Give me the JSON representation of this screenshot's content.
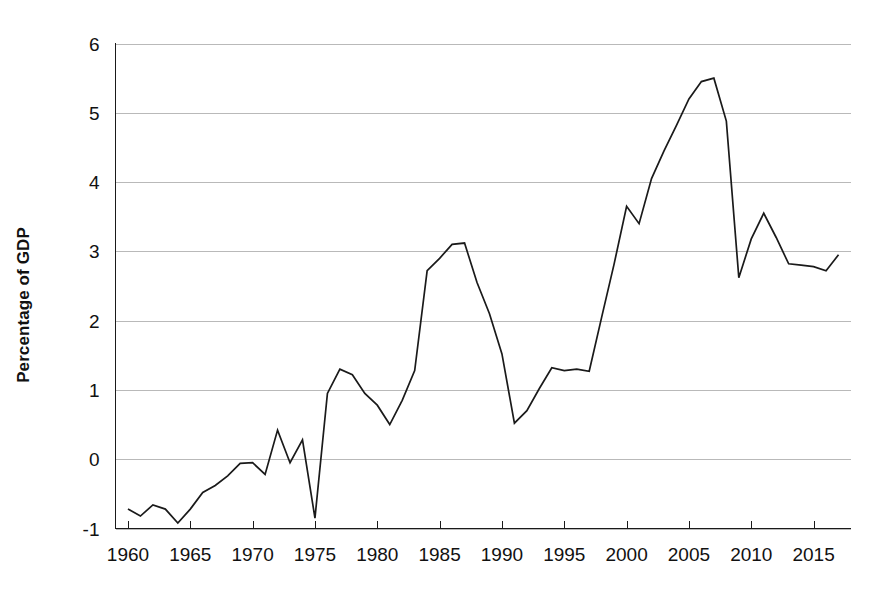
{
  "chart_data": {
    "type": "line",
    "title": "",
    "subtitle": "",
    "xlabel": "",
    "ylabel": "Percentage of GDP",
    "xlim": [
      1959,
      2018
    ],
    "ylim": [
      -1,
      6
    ],
    "grid": true,
    "grid_axis": "y",
    "legend": false,
    "legend_position": "none",
    "line_color": "#1a1a1a",
    "grid_color": "#b9b9b9",
    "axis_color": "#1a1a1a",
    "background_color": "#ffffff",
    "y_ticks": [
      -1,
      0,
      1,
      2,
      3,
      4,
      5,
      6
    ],
    "y_tick_labels": [
      "-1",
      "0",
      "1",
      "2",
      "3",
      "4",
      "5",
      "6"
    ],
    "x_ticks": [
      1960,
      1965,
      1970,
      1975,
      1980,
      1985,
      1990,
      1995,
      2000,
      2005,
      2010,
      2015
    ],
    "x_tick_labels": [
      "1960",
      "1965",
      "1970",
      "1975",
      "1980",
      "1985",
      "1990",
      "1995",
      "2000",
      "2005",
      "2010",
      "2015"
    ],
    "x": [
      1960,
      1961,
      1962,
      1963,
      1964,
      1965,
      1966,
      1967,
      1968,
      1969,
      1970,
      1971,
      1972,
      1973,
      1974,
      1975,
      1976,
      1977,
      1978,
      1979,
      1980,
      1981,
      1982,
      1983,
      1984,
      1985,
      1986,
      1987,
      1988,
      1989,
      1990,
      1991,
      1992,
      1993,
      1994,
      1995,
      1996,
      1997,
      1998,
      1999,
      2000,
      2001,
      2002,
      2003,
      2004,
      2005,
      2006,
      2007,
      2008,
      2009,
      2010,
      2011,
      2012,
      2013,
      2014,
      2015,
      2016,
      2017
    ],
    "values": [
      -0.72,
      -0.82,
      -0.66,
      -0.72,
      -0.92,
      -0.72,
      -0.48,
      -0.38,
      -0.24,
      -0.06,
      -0.05,
      -0.22,
      0.42,
      -0.05,
      0.28,
      -0.85,
      0.95,
      1.3,
      1.22,
      0.95,
      0.78,
      0.5,
      0.85,
      1.28,
      2.72,
      2.9,
      3.1,
      3.12,
      2.55,
      2.1,
      1.52,
      0.52,
      0.7,
      1.02,
      1.32,
      1.28,
      1.3,
      1.27,
      2.05,
      2.82,
      3.65,
      3.4,
      4.05,
      4.45,
      4.82,
      5.2,
      5.45,
      5.5,
      4.88,
      2.62,
      3.18,
      3.55,
      3.2,
      2.82,
      2.8,
      2.78,
      2.72,
      2.95
    ],
    "series": [
      {
        "name": "Percentage of GDP",
        "values": [
          -0.72,
          -0.82,
          -0.66,
          -0.72,
          -0.92,
          -0.72,
          -0.48,
          -0.38,
          -0.24,
          -0.06,
          -0.05,
          -0.22,
          0.42,
          -0.05,
          0.28,
          -0.85,
          0.95,
          1.3,
          1.22,
          0.95,
          0.78,
          0.5,
          0.85,
          1.28,
          2.72,
          2.9,
          3.1,
          3.12,
          2.55,
          2.1,
          1.52,
          0.52,
          0.7,
          1.02,
          1.32,
          1.28,
          1.3,
          1.27,
          2.05,
          2.82,
          3.65,
          3.4,
          4.05,
          4.45,
          4.82,
          5.2,
          5.45,
          5.5,
          4.88,
          2.62,
          3.18,
          3.55,
          3.2,
          2.82,
          2.8,
          2.78,
          2.72,
          2.95
        ]
      }
    ],
    "annotations": []
  }
}
